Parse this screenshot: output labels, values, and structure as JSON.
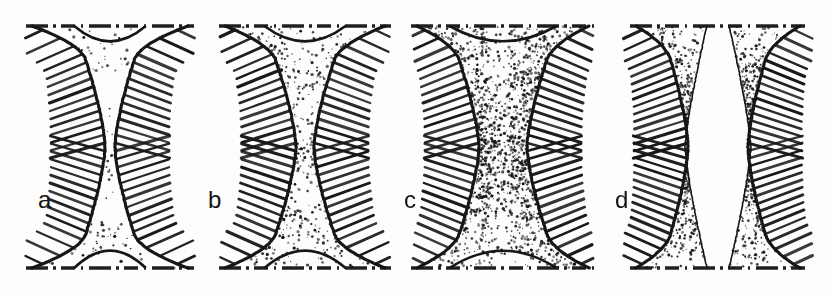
{
  "figure": {
    "title": "Successive stages of neck formation between two particles",
    "background_color": "#fdfdfb",
    "ink_color": "#141414",
    "width": 833,
    "height": 295
  },
  "panels": [
    {
      "id": "a",
      "label": "a",
      "label_x": 38,
      "label_y": 188,
      "x": 20,
      "width": 180,
      "neck_half_width": 5,
      "body_half_width": 36,
      "flare_half_width": 78,
      "description": "very narrow neck, hatched boundaries nearly touching along the axis",
      "stipple_density": 26,
      "hatch_count": 30,
      "gap": false
    },
    {
      "id": "b",
      "label": "b",
      "label_x": 208,
      "label_y": 188,
      "x": 215,
      "width": 180,
      "neck_half_width": 9,
      "body_half_width": 42,
      "flare_half_width": 80,
      "description": "narrow neck with stippled funnel regions above and below",
      "stipple_density": 60,
      "hatch_count": 30,
      "gap": false
    },
    {
      "id": "c",
      "label": "c",
      "label_x": 404,
      "label_y": 188,
      "x": 408,
      "width": 190,
      "neck_half_width": 24,
      "body_half_width": 56,
      "flare_half_width": 86,
      "description": "wide stippled neck, hourglass profile fully filled with stipple",
      "stipple_density": 150,
      "hatch_count": 30,
      "gap": false
    },
    {
      "id": "d",
      "label": "d",
      "label_x": 615,
      "label_y": 188,
      "x": 618,
      "width": 200,
      "neck_half_width": 30,
      "body_half_width": 58,
      "flare_half_width": 82,
      "description": "two separated crescent lenses with an open white gap on the axis",
      "stipple_density": 95,
      "hatch_count": 32,
      "gap": true
    }
  ],
  "axis_lines": {
    "style": "dash-dot",
    "top_y": 26,
    "bottom_y": 268,
    "label": "axis-of-symmetry-line"
  },
  "chart_data": {
    "type": "line",
    "xlabel": "stage",
    "ylabel": "neck half-width (px)",
    "categories": [
      "a",
      "b",
      "c",
      "d"
    ],
    "series": [
      {
        "name": "neck half-width",
        "values": [
          5,
          9,
          24,
          30
        ]
      },
      {
        "name": "body half-width",
        "values": [
          36,
          42,
          56,
          58
        ]
      },
      {
        "name": "flare half-width",
        "values": [
          78,
          80,
          86,
          82
        ]
      }
    ],
    "ylim": [
      0,
      100
    ],
    "grid": false,
    "legend": "none"
  }
}
